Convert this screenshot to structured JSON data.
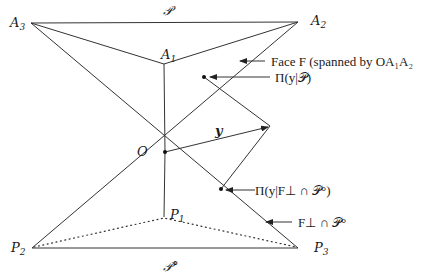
{
  "figure": {
    "vertex_labels": {
      "A3": {
        "base": "A",
        "sub": "3"
      },
      "A2": {
        "base": "A",
        "sub": "2"
      },
      "A1": {
        "base": "A",
        "sub": "1"
      },
      "O": {
        "base": "O",
        "sub": ""
      },
      "P1": {
        "base": "P",
        "sub": "1"
      },
      "P2": {
        "base": "P",
        "sub": "2"
      },
      "P3": {
        "base": "P",
        "sub": "3"
      }
    },
    "cone_label": "𝒫",
    "polar_cone_label": "𝒫°",
    "vector_label": "y",
    "annotations": {
      "face": "Face F (spanned by OA₁A₂",
      "proj_cone": "Π(y|𝒫)",
      "proj_polar": "Π(y|F⊥ ∩ 𝒫°)",
      "polar_face": "F⊥ ∩ 𝒫°"
    }
  }
}
